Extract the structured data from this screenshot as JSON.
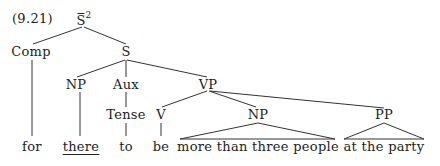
{
  "example_number": "(9.21)",
  "tree": {
    "root": {
      "label": "S",
      "bar": true,
      "superscript": "2"
    },
    "comp": "Comp",
    "s": "S",
    "np_subject": "NP",
    "aux": "Aux",
    "tense": "Tense",
    "vp": "VP",
    "v": "V",
    "np_object": "NP",
    "pp": "PP"
  },
  "words": {
    "for": "for",
    "there": "there",
    "to": "to",
    "be": "be",
    "np_phrase": "more than three people",
    "pp_phrase": "at the party"
  }
}
